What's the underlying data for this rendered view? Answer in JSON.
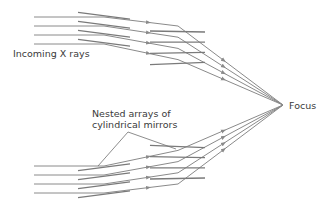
{
  "labels": {
    "incoming": "Incoming X rays",
    "focus": "Focus",
    "nested_line1": "Nested arrays of",
    "nested_line2": "cylindrical mirrors"
  },
  "colors": {
    "ray": "#8a8a8a",
    "mirror": "#7a7a7a",
    "callout": "#707070",
    "text": "#3a3a3a",
    "background": "#ffffff"
  },
  "geometry": {
    "focus": [
      283,
      105
    ],
    "ray_start_x": 34,
    "upper_ray_y": [
      17,
      26,
      35,
      44
    ],
    "lower_ray_y": [
      166,
      175,
      184,
      193
    ]
  }
}
